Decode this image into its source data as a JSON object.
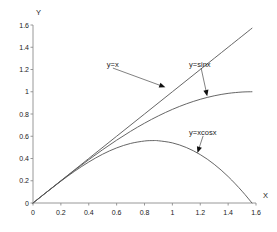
{
  "chart_data": {
    "type": "line",
    "title": "",
    "xlabel": "X",
    "ylabel": "Y",
    "xlim": [
      0,
      1.6
    ],
    "ylim": [
      0,
      1.6
    ],
    "grid": false,
    "legend_position": "inline-annotations",
    "xticks": [
      "0",
      "0.2",
      "0.4",
      "0.6",
      "0.8",
      "1",
      "1.2",
      "1.4",
      "1.6"
    ],
    "yticks": [
      "0",
      "0.2",
      "0.4",
      "0.6",
      "0.8",
      "1",
      "1.2",
      "1.4",
      "1.6"
    ],
    "xtick_values": [
      0,
      0.2,
      0.4,
      0.6,
      0.8,
      1,
      1.2,
      1.4,
      1.6
    ],
    "ytick_values": [
      0,
      0.2,
      0.4,
      0.6,
      0.8,
      1,
      1.2,
      1.4,
      1.6
    ],
    "line_color": "#555555",
    "series": [
      {
        "name": "y=x",
        "label": "y=x",
        "x": [
          0,
          0.2,
          0.4,
          0.6,
          0.8,
          1.0,
          1.2,
          1.4,
          1.571
        ],
        "values": [
          0,
          0.2,
          0.4,
          0.6,
          0.8,
          1.0,
          1.2,
          1.4,
          1.571
        ]
      },
      {
        "name": "y=sinx",
        "label": "y=sinx",
        "x": [
          0,
          0.1,
          0.2,
          0.3,
          0.4,
          0.5,
          0.6,
          0.7,
          0.8,
          0.9,
          1.0,
          1.1,
          1.2,
          1.3,
          1.4,
          1.5,
          1.571
        ],
        "values": [
          0,
          0.0998,
          0.1987,
          0.2955,
          0.3894,
          0.4794,
          0.5646,
          0.6442,
          0.7174,
          0.7833,
          0.8415,
          0.8912,
          0.932,
          0.9636,
          0.9854,
          0.9975,
          1.0
        ]
      },
      {
        "name": "y=xcosx",
        "label": "y=xcosx",
        "x": [
          0,
          0.1,
          0.2,
          0.3,
          0.4,
          0.5,
          0.6,
          0.7,
          0.8,
          0.86,
          0.9,
          1.0,
          1.1,
          1.2,
          1.3,
          1.4,
          1.5,
          1.571
        ],
        "values": [
          0,
          0.0995,
          0.196,
          0.2866,
          0.3684,
          0.4388,
          0.4952,
          0.5353,
          0.5573,
          0.561,
          0.5594,
          0.5403,
          0.4989,
          0.435,
          0.3478,
          0.238,
          0.1061,
          0
        ]
      }
    ],
    "annotations": [
      {
        "text": "y=x",
        "label_x": 0.53,
        "label_y": 1.24,
        "point_x": 0.95,
        "point_y": 1.04
      },
      {
        "text": "y=sinx",
        "label_x": 1.12,
        "label_y": 1.24,
        "point_x": 1.25,
        "point_y": 0.96
      },
      {
        "text": "y=xcosx",
        "label_x": 1.12,
        "label_y": 0.63,
        "point_x": 1.18,
        "point_y": 0.45
      }
    ]
  }
}
